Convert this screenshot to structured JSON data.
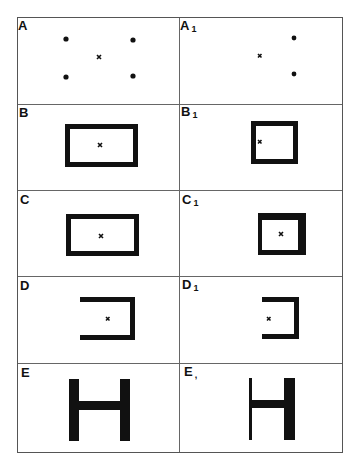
{
  "figure": {
    "panels": [
      {
        "id": "A",
        "label": "A",
        "subscript": "",
        "shape": "four dots around a center cross"
      },
      {
        "id": "A1",
        "label": "A",
        "subscript": "1",
        "shape": "two dots and an off-center cross"
      },
      {
        "id": "B",
        "label": "B",
        "subscript": "",
        "shape": "rectangle outline with center cross"
      },
      {
        "id": "B1",
        "label": "B",
        "subscript": "1",
        "shape": "smaller rectangle outline with cross near left side"
      },
      {
        "id": "C",
        "label": "C",
        "subscript": "",
        "shape": "rectangle outline with center cross"
      },
      {
        "id": "C1",
        "label": "C",
        "subscript": "1",
        "shape": "square outline with thicker top/right edges and center cross"
      },
      {
        "id": "D",
        "label": "D",
        "subscript": "",
        "shape": "open bracket (left side open) with cross"
      },
      {
        "id": "D1",
        "label": "D",
        "subscript": "1",
        "shape": "smaller open bracket with cross at opening"
      },
      {
        "id": "E",
        "label": "E",
        "subscript": "",
        "shape": "letter H with equal thick uprights"
      },
      {
        "id": "E1",
        "label": "E",
        "subscript": ",",
        "shape": "letter H with thin left upright and thick right upright"
      }
    ],
    "colors": {
      "ink": "#111111",
      "border": "#555555",
      "background": "#ffffff"
    }
  }
}
